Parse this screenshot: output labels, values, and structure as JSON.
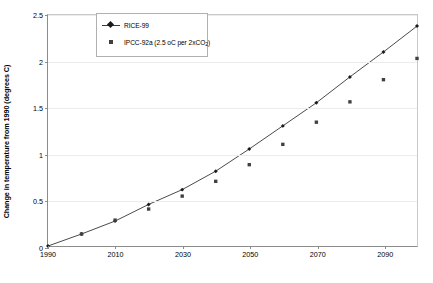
{
  "chart_data": {
    "type": "line",
    "title": "",
    "xlabel": "",
    "ylabel": "Change in temperature from 1990 (degrees C)",
    "xlim": [
      1990,
      2100
    ],
    "ylim": [
      0,
      2.5
    ],
    "xticks": [
      1990,
      2010,
      2030,
      2050,
      2070,
      2090
    ],
    "xtick_labels": [
      "1990",
      "2010",
      "2030",
      "2050",
      "2070",
      "2090"
    ],
    "yticks": [
      0,
      0.5,
      1,
      1.5,
      2,
      2.5
    ],
    "ytick_labels": [
      "0",
      "0.5",
      "1",
      "1.5",
      "2",
      "2.5"
    ],
    "grid": "horizontal",
    "legend_position": "top-left-inside",
    "x": [
      1990,
      1995,
      2000,
      2005,
      2010,
      2015,
      2020,
      2025,
      2030,
      2035,
      2040,
      2045,
      2050,
      2055,
      2060,
      2065,
      2070,
      2075,
      2080,
      2085,
      2090,
      2095,
      2100
    ],
    "series": [
      {
        "name": "RICE-99",
        "marker": "diamond",
        "style": "line-with-markers",
        "color": "#1a1a1a",
        "x": [
          1990,
          2000,
          2010,
          2020,
          2030,
          2040,
          2050,
          2060,
          2070,
          2080,
          2090,
          2100
        ],
        "values": [
          0,
          0.13,
          0.27,
          0.45,
          0.61,
          0.81,
          1.05,
          1.3,
          1.55,
          1.83,
          2.1,
          2.38
        ]
      },
      {
        "name": "IPCC-92a (2.5 oC per 2xCO2)",
        "marker": "square",
        "style": "markers-only",
        "color": "#404040",
        "x": [
          2000,
          2010,
          2020,
          2030,
          2040,
          2050,
          2060,
          2070,
          2080,
          2090,
          2100
        ],
        "values": [
          0.13,
          0.28,
          0.4,
          0.54,
          0.7,
          0.88,
          1.1,
          1.34,
          1.56,
          1.8,
          2.03
        ]
      }
    ]
  },
  "legend": {
    "entries": [
      {
        "label": "RICE-99"
      },
      {
        "label_prefix": "IPCC-92a (2.5 oC per 2xCO",
        "label_sub": "2",
        "label_suffix": ")"
      }
    ]
  },
  "axes": {
    "y_title": "Change in temperature from 1990 (degrees C)"
  },
  "colors": {
    "line": "#3a3a3a",
    "marker_rice": "#1a1a1a",
    "marker_ipcc": "#404040",
    "axis": "#8c8c8c",
    "grid": "#ececec",
    "background": "#ffffff",
    "text": "#000000"
  }
}
